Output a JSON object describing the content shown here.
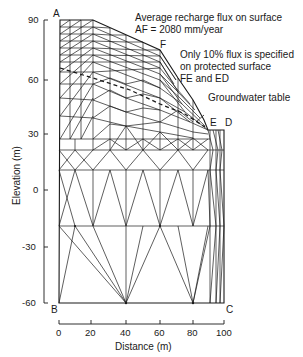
{
  "figure": {
    "annotations": {
      "recharge_line1": "Average recharge flux on surface",
      "recharge_line2": "AF = 2080 mm/year",
      "protected_line1": "Only 10% flux is specified",
      "protected_line2": "on protected surface",
      "protected_line3": "FE and ED",
      "groundwater": "Groundwater table"
    },
    "corners": {
      "A": "A",
      "B": "B",
      "C": "C",
      "D": "D",
      "E": "E",
      "F": "F"
    },
    "y_axis": {
      "label": "Elevation (m)",
      "ticks": [
        "90",
        "60",
        "30",
        "0",
        "-30",
        "-60"
      ]
    },
    "x_axis": {
      "label": "Distance (m)",
      "ticks": [
        "0",
        "20",
        "40",
        "60",
        "80",
        "100"
      ]
    }
  }
}
